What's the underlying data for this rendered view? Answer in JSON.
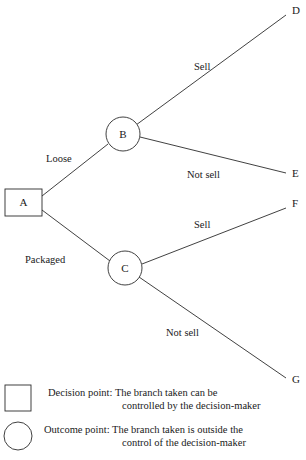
{
  "diagram": {
    "type": "decision-tree",
    "nodes": [
      {
        "id": "A",
        "label": "A",
        "shape": "square",
        "role": "decision-point",
        "x": 23,
        "y": 202
      },
      {
        "id": "B",
        "label": "B",
        "shape": "circle",
        "role": "outcome-point",
        "x": 123,
        "y": 134
      },
      {
        "id": "C",
        "label": "C",
        "shape": "circle",
        "role": "outcome-point",
        "x": 125,
        "y": 268
      }
    ],
    "endpoints": [
      {
        "id": "D",
        "label": "D",
        "x": 292,
        "y": 14
      },
      {
        "id": "E",
        "label": "E",
        "x": 292,
        "y": 173
      },
      {
        "id": "F",
        "label": "F",
        "x": 292,
        "y": 207
      },
      {
        "id": "G",
        "label": "G",
        "x": 292,
        "y": 379
      }
    ],
    "branches": [
      {
        "id": "a-to-b",
        "from": "A",
        "to": "B",
        "label": "Loose",
        "label_x": 46,
        "label_y": 162
      },
      {
        "id": "a-to-c",
        "from": "A",
        "to": "C",
        "label": "Packaged",
        "label_x": 25,
        "label_y": 263
      },
      {
        "id": "b-to-d",
        "from": "B",
        "to": "D",
        "label": "Sell",
        "label_x": 194,
        "label_y": 70
      },
      {
        "id": "b-to-e",
        "from": "B",
        "to": "E",
        "label": "Not sell",
        "label_x": 187,
        "label_y": 178
      },
      {
        "id": "c-to-f",
        "from": "C",
        "to": "F",
        "label": "Sell",
        "label_x": 194,
        "label_y": 228
      },
      {
        "id": "c-to-g",
        "from": "C",
        "to": "G",
        "label": "Not sell",
        "label_x": 166,
        "label_y": 336
      }
    ]
  },
  "legend": {
    "items": [
      {
        "shape": "square",
        "line1": "Decision point: The branch taken can be",
        "line2": "controlled by the decision-maker"
      },
      {
        "shape": "circle",
        "line1": "Outcome point: The branch taken is outside the",
        "line2": "control of the decision-maker"
      }
    ]
  },
  "colors": {
    "stroke": "#2b2b2b",
    "text": "#1a1a1a",
    "background": "#ffffff"
  }
}
